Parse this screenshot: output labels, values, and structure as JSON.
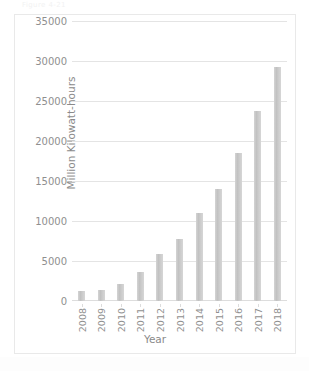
{
  "scan": {
    "top_artifact_text": "Figure 4-21"
  },
  "chart_data": {
    "type": "bar",
    "title": "",
    "xlabel": "Year",
    "ylabel": "Million Kilowatt-hours",
    "categories": [
      "2008",
      "2009",
      "2010",
      "2011",
      "2012",
      "2013",
      "2014",
      "2015",
      "2016",
      "2017",
      "2018"
    ],
    "values": [
      1200,
      1400,
      2100,
      3600,
      5900,
      7800,
      11000,
      14000,
      18500,
      23700,
      29300
    ],
    "ylim": [
      0,
      35000
    ],
    "ytick_labels": [
      "0",
      "5000",
      "10000",
      "15000",
      "20000",
      "25000",
      "30000",
      "35000"
    ],
    "ytick_values": [
      0,
      5000,
      10000,
      15000,
      20000,
      25000,
      30000,
      35000
    ],
    "grid": true,
    "legend": false,
    "bar_color": "#c8c8c8",
    "gridline_color": "#e4e4e4",
    "text_color": "#8f8f8f"
  }
}
